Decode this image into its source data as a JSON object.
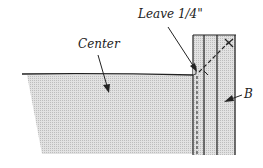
{
  "diagram": {
    "type": "sewing-instruction",
    "labels": {
      "leave": "Leave 1/4\"",
      "center": "Center",
      "b": "B"
    },
    "colors": {
      "fill": "#d4d4d4",
      "stroke": "#222222",
      "background": "#ffffff"
    }
  }
}
